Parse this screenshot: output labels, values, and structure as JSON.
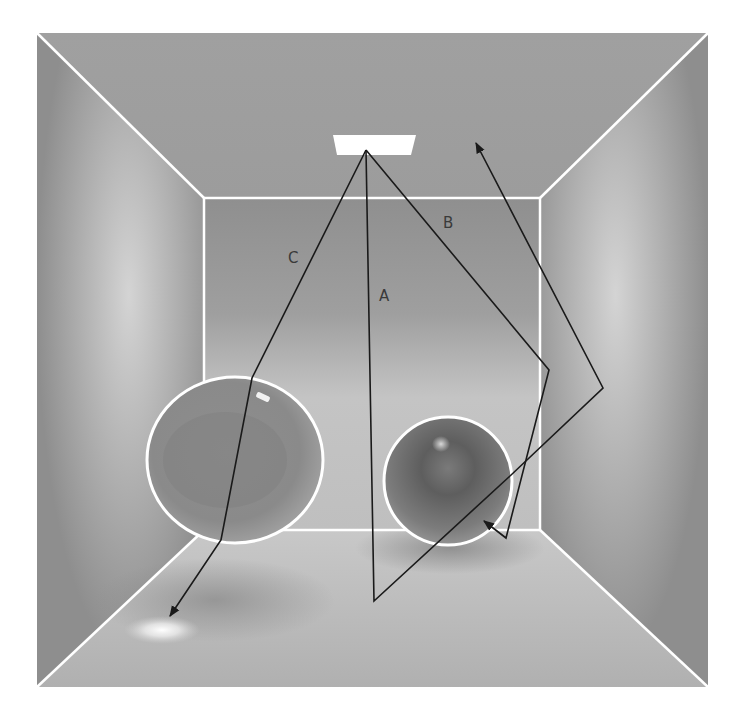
{
  "diagram": {
    "type": "ray-tracing-cornell-box",
    "frame": {
      "x1": 37,
      "y1": 33,
      "x2": 708,
      "y2": 687
    },
    "back_wall": {
      "x1": 204,
      "y1": 198,
      "x2": 540,
      "y2": 530
    },
    "light": {
      "points": "333,135 416,135 411,155 337,155",
      "color": "#ffffff"
    },
    "spheres": [
      {
        "name": "glass-sphere",
        "cx": 235,
        "cy": 460,
        "rx": 88,
        "ry": 83
      },
      {
        "name": "diffuse-sphere",
        "cx": 448,
        "cy": 481,
        "rx": 64,
        "ry": 64
      }
    ],
    "rays": [
      {
        "label": "A",
        "label_x": 385,
        "label_y": 300,
        "points": "366,150 374,601 510,476"
      },
      {
        "label": "B",
        "label_x": 449,
        "label_y": 228,
        "points": "366,150 549,370 506,538 484,521"
      },
      {
        "label": "C",
        "label_x": 293,
        "label_y": 262,
        "points": "366,150 252,378 221,540 170,616"
      },
      {
        "label": "",
        "label_x": 0,
        "label_y": 0,
        "points": "603,388 476,143"
      }
    ],
    "colors": {
      "wall": "#9a9a9a",
      "back_wall": "#a8a8a8",
      "floor": "#bdbdbd",
      "edge": "#ffffff",
      "ray": "#1a1a1a"
    }
  }
}
